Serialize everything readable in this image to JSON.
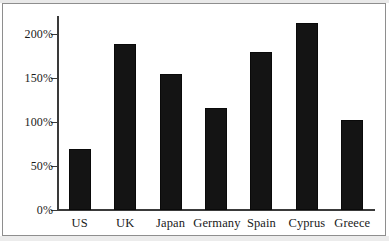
{
  "chart_data": {
    "type": "bar",
    "title": "",
    "subtitle": "",
    "xlabel": "",
    "ylabel": "",
    "categories": [
      "US",
      "UK",
      "Japan",
      "Germany",
      "Spain",
      "Cyprus",
      "Greece"
    ],
    "values": [
      69,
      189,
      155,
      116,
      180,
      212,
      102
    ],
    "value_labels": [
      "69%",
      "189%",
      "155%",
      "116%",
      "180%",
      "212%",
      "102%"
    ],
    "series": [
      {
        "name": "",
        "values": [
          69,
          189,
          155,
          116,
          180,
          212,
          102
        ]
      }
    ],
    "ylim": [
      0,
      220
    ],
    "yticks": [
      0,
      50,
      100,
      150,
      200
    ],
    "ytick_labels": [
      "0%",
      "50%",
      "100%",
      "150%",
      "200%"
    ],
    "grid": false,
    "legend": null,
    "legend_position": "none",
    "annotations": [],
    "bar_color": "#141414",
    "axis_color": "#3a3a3a",
    "background_color": "#ffffff",
    "frame_color": "#8e8e8e"
  }
}
